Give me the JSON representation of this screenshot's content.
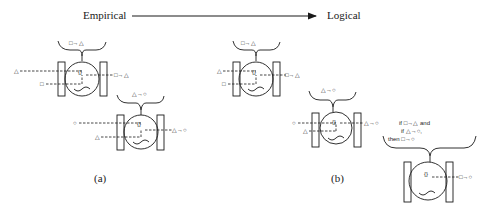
{
  "header": {
    "left_label": "Empirical",
    "right_label": "Logical"
  },
  "panels": {
    "a": {
      "caption": "(a)"
    },
    "b": {
      "caption": "(b)"
    }
  },
  "rules": {
    "sq_tri": "□→△",
    "tri_circ": "△→○",
    "sq_circ": "□→○"
  },
  "logic_box": {
    "line1": "if □→△ and",
    "line2": "if △→○,",
    "line3": "then □→○"
  },
  "symbols": {
    "triangle": "△",
    "square": "□",
    "circle": "○",
    "brain": "{}"
  }
}
